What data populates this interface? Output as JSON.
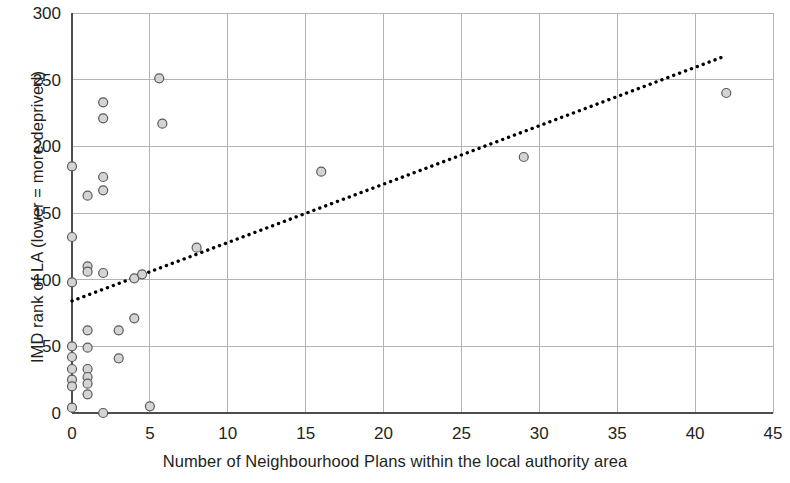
{
  "chart_data": {
    "type": "scatter",
    "title": "",
    "xlabel": "Number of Neighbourhood Plans within the local authority area",
    "ylabel": "IMD rank of LA (lower = more deprived)",
    "xlim": [
      0,
      45
    ],
    "ylim": [
      0,
      300
    ],
    "xticks": [
      0,
      5,
      10,
      15,
      20,
      25,
      30,
      35,
      40,
      45
    ],
    "yticks": [
      0,
      50,
      100,
      150,
      200,
      250,
      300
    ],
    "xtick_labels": [
      "0",
      "5",
      "10",
      "15",
      "20",
      "25",
      "30",
      "35",
      "40",
      "45"
    ],
    "ytick_labels": [
      "0",
      "50",
      "100",
      "150",
      "200",
      "250",
      "300"
    ],
    "grid": "both",
    "legend": "none",
    "marker": {
      "shape": "circle",
      "fill_color": "#d4d4d4",
      "edge_color": "#5a5a5a",
      "size_px": 9
    },
    "points": [
      {
        "x": 0,
        "y": 185
      },
      {
        "x": 0,
        "y": 132
      },
      {
        "x": 0,
        "y": 98
      },
      {
        "x": 0,
        "y": 50
      },
      {
        "x": 0,
        "y": 42
      },
      {
        "x": 0,
        "y": 33
      },
      {
        "x": 0,
        "y": 25
      },
      {
        "x": 0,
        "y": 20
      },
      {
        "x": 0,
        "y": 4
      },
      {
        "x": 1,
        "y": 163
      },
      {
        "x": 1,
        "y": 110
      },
      {
        "x": 1,
        "y": 106
      },
      {
        "x": 1,
        "y": 62
      },
      {
        "x": 1,
        "y": 49
      },
      {
        "x": 1,
        "y": 33
      },
      {
        "x": 1,
        "y": 27
      },
      {
        "x": 1,
        "y": 22
      },
      {
        "x": 1,
        "y": 14
      },
      {
        "x": 2,
        "y": 233
      },
      {
        "x": 2,
        "y": 221
      },
      {
        "x": 2,
        "y": 177
      },
      {
        "x": 2,
        "y": 167
      },
      {
        "x": 2,
        "y": 105
      },
      {
        "x": 2,
        "y": 0
      },
      {
        "x": 3,
        "y": 62
      },
      {
        "x": 3,
        "y": 41
      },
      {
        "x": 4,
        "y": 101
      },
      {
        "x": 4,
        "y": 71
      },
      {
        "x": 4.5,
        "y": 104
      },
      {
        "x": 5,
        "y": 5
      },
      {
        "x": 5.6,
        "y": 251
      },
      {
        "x": 5.8,
        "y": 217
      },
      {
        "x": 8,
        "y": 124
      },
      {
        "x": 16,
        "y": 181
      },
      {
        "x": 29,
        "y": 192
      },
      {
        "x": 42,
        "y": 240
      }
    ],
    "trendline": {
      "style": "dotted",
      "color": "#000000",
      "x_start": 0,
      "y_start": 84,
      "x_end": 42,
      "y_end": 268
    }
  }
}
